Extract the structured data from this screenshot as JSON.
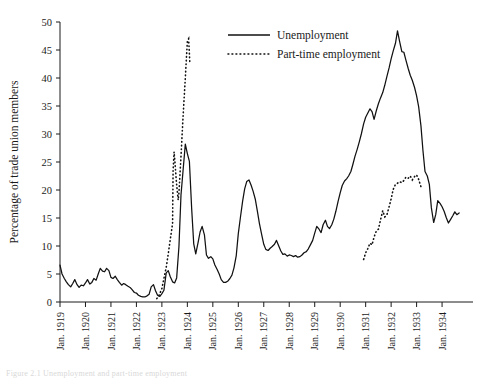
{
  "figure": {
    "caption": "Figure 2.1 Unemployment and part-time employment"
  },
  "chart_data": {
    "type": "line",
    "title": "",
    "xlabel": "",
    "ylabel": "Percentage of trade union members",
    "xlim": [
      1919.0,
      1934.9
    ],
    "ylim": [
      0,
      50
    ],
    "grid": false,
    "legend_position": "top-center-right",
    "y_ticks": [
      0,
      5,
      10,
      15,
      20,
      25,
      30,
      35,
      40,
      45,
      50
    ],
    "x_ticks": [
      1919,
      1920,
      1921,
      1922,
      1923,
      1924,
      1925,
      1926,
      1927,
      1928,
      1929,
      1930,
      1931,
      1932,
      1933,
      1934
    ],
    "x_tick_labels": [
      "Jan. 1919",
      "Jan. 1920",
      "Jan. 1921",
      "Jan. 1922",
      "Jan. 1923",
      "Jan. 1924",
      "Jan. 1925",
      "Jan. 1926",
      "Jan. 1927",
      "Jan. 1928",
      "Jan. 1929",
      "Jan. 1930",
      "Jan. 1931",
      "Jan. 1932",
      "Jan. 1933",
      "Jan. 1934"
    ],
    "series": [
      {
        "name": "Unemployment",
        "style": "solid",
        "x": [
          1919.0,
          1919.08,
          1919.17,
          1919.25,
          1919.33,
          1919.42,
          1919.5,
          1919.58,
          1919.67,
          1919.75,
          1919.83,
          1919.92,
          1920.0,
          1920.08,
          1920.17,
          1920.25,
          1920.33,
          1920.42,
          1920.5,
          1920.58,
          1920.67,
          1920.75,
          1920.83,
          1920.92,
          1921.0,
          1921.08,
          1921.17,
          1921.25,
          1921.33,
          1921.42,
          1921.5,
          1921.58,
          1921.67,
          1921.75,
          1921.83,
          1921.92,
          1922.0,
          1922.08,
          1922.17,
          1922.25,
          1922.33,
          1922.42,
          1922.5,
          1922.58,
          1922.67,
          1922.75,
          1922.83,
          1922.92,
          1923.0,
          1923.08,
          1923.17,
          1923.25,
          1923.33,
          1923.42,
          1923.5,
          1923.58,
          1923.67,
          1923.75,
          1923.83,
          1923.92,
          1924.0,
          1924.08,
          1924.17,
          1924.25,
          1924.33,
          1924.42,
          1924.5,
          1924.58,
          1924.67,
          1924.75,
          1924.83,
          1924.92,
          1925.0,
          1925.08,
          1925.17,
          1925.25,
          1925.33,
          1925.42,
          1925.5,
          1925.58,
          1925.67,
          1925.75,
          1925.83,
          1925.92,
          1926.0,
          1926.08,
          1926.17,
          1926.25,
          1926.33,
          1926.42,
          1926.5,
          1926.58,
          1926.67,
          1926.75,
          1926.83,
          1926.92,
          1927.0,
          1927.08,
          1927.17,
          1927.25,
          1927.33,
          1927.42,
          1927.5,
          1927.58,
          1927.67,
          1927.75,
          1927.83,
          1927.92,
          1928.0,
          1928.08,
          1928.17,
          1928.25,
          1928.33,
          1928.42,
          1928.5,
          1928.58,
          1928.67,
          1928.75,
          1928.83,
          1928.92,
          1929.0,
          1929.08,
          1929.17,
          1929.25,
          1929.33,
          1929.42,
          1929.5,
          1929.58,
          1929.67,
          1929.75,
          1929.83,
          1929.92,
          1930.0,
          1930.08,
          1930.17,
          1930.25,
          1930.33,
          1930.42,
          1930.5,
          1930.58,
          1930.67,
          1930.75,
          1930.83,
          1930.92,
          1931.0,
          1931.08,
          1931.17,
          1931.25,
          1931.33,
          1931.42,
          1931.5,
          1931.58,
          1931.67,
          1931.75,
          1931.83,
          1931.92,
          1932.0,
          1932.08,
          1932.17,
          1932.25,
          1932.33,
          1932.42,
          1932.5,
          1932.58,
          1932.67,
          1932.75,
          1932.83,
          1932.92,
          1933.0,
          1933.08,
          1933.17,
          1933.25,
          1933.33,
          1933.42,
          1933.5,
          1933.58,
          1933.67,
          1933.75,
          1933.83,
          1933.92,
          1934.0,
          1934.08,
          1934.17,
          1934.25,
          1934.33,
          1934.42,
          1934.5,
          1934.58,
          1934.67
        ],
        "values": [
          6.6,
          5.0,
          4.2,
          3.6,
          3.1,
          2.7,
          3.3,
          4.0,
          3.1,
          2.6,
          3.0,
          2.9,
          3.4,
          4.0,
          3.2,
          3.5,
          4.2,
          3.9,
          5.0,
          6.0,
          5.5,
          5.4,
          6.0,
          5.6,
          4.4,
          4.2,
          4.6,
          4.0,
          3.5,
          3.0,
          3.3,
          3.1,
          2.8,
          2.6,
          2.2,
          1.7,
          1.6,
          1.2,
          1.0,
          0.9,
          0.9,
          1.1,
          1.4,
          2.7,
          3.1,
          2.0,
          1.2,
          1.0,
          1.5,
          2.1,
          5.2,
          5.6,
          4.5,
          3.6,
          3.4,
          4.3,
          9.9,
          19.1,
          23.4,
          28.2,
          26.5,
          25.1,
          16.6,
          10.4,
          8.6,
          10.6,
          12.5,
          13.5,
          12.0,
          8.4,
          7.8,
          8.1,
          7.7,
          6.6,
          5.8,
          5.0,
          4.0,
          3.5,
          3.5,
          3.7,
          4.2,
          4.8,
          6.1,
          8.3,
          12.2,
          15.0,
          18.0,
          20.2,
          21.5,
          21.8,
          20.9,
          19.8,
          18.3,
          16.2,
          14.0,
          12.0,
          10.3,
          9.4,
          9.2,
          9.6,
          9.9,
          10.3,
          11.0,
          10.1,
          9.1,
          8.5,
          8.6,
          8.2,
          8.4,
          8.3,
          8.1,
          8.3,
          8.0,
          8.1,
          8.4,
          8.8,
          9.0,
          9.5,
          10.2,
          11.0,
          12.3,
          13.5,
          13.0,
          12.4,
          13.8,
          14.6,
          13.5,
          13.1,
          13.8,
          14.8,
          16.2,
          18.0,
          19.5,
          20.8,
          21.6,
          22.0,
          22.5,
          23.3,
          24.6,
          26.0,
          27.3,
          28.6,
          30.0,
          31.8,
          33.0,
          33.7,
          34.5,
          34.0,
          32.6,
          34.2,
          35.4,
          36.4,
          37.4,
          38.7,
          40.2,
          41.8,
          43.4,
          44.8,
          46.2,
          48.4,
          46.6,
          44.7,
          44.6,
          43.2,
          41.7,
          40.5,
          39.6,
          38.3,
          36.8,
          34.9,
          31.5,
          27.0,
          23.3,
          22.5,
          21.0,
          16.8,
          14.2,
          15.6,
          18.1,
          17.6,
          17.0,
          16.2,
          15.0,
          14.1,
          14.7,
          15.4,
          16.1,
          15.6,
          15.9
        ]
      },
      {
        "name": "Part-time employment",
        "style": "dotted",
        "segments": [
          {
            "x": [
              1922.8,
              1922.9,
              1923.0,
              1923.08,
              1923.17,
              1923.25,
              1923.33,
              1923.42,
              1923.44,
              1923.48,
              1923.52,
              1923.56,
              1923.6,
              1923.64,
              1923.67,
              1923.75,
              1923.83,
              1923.92,
              1924.0,
              1924.05,
              1924.1
            ],
            "values": [
              0.6,
              1.3,
              2.4,
              4.2,
              6.2,
              8.6,
              11.2,
              14.0,
              23.5,
              26.8,
              24.6,
              22.0,
              20.0,
              18.2,
              19.5,
              26.0,
              33.0,
              40.0,
              46.6,
              47.0,
              42.5
            ]
          },
          {
            "x": [
              1930.92,
              1931.0,
              1931.08,
              1931.17,
              1931.25,
              1931.33,
              1931.42,
              1931.5,
              1931.58,
              1931.67,
              1931.75,
              1931.83,
              1931.92,
              1932.0,
              1932.08,
              1932.17,
              1932.25,
              1932.33,
              1932.42,
              1932.5,
              1932.58,
              1932.67,
              1932.75,
              1932.83,
              1932.92,
              1933.0,
              1933.08,
              1933.17
            ],
            "values": [
              7.6,
              8.8,
              9.5,
              10.5,
              10.2,
              11.6,
              12.7,
              13.0,
              14.6,
              16.3,
              15.2,
              15.5,
              17.0,
              18.4,
              20.1,
              21.0,
              21.2,
              21.5,
              21.3,
              21.7,
              22.3,
              22.1,
              22.5,
              21.8,
              22.4,
              22.7,
              21.9,
              20.6
            ]
          }
        ]
      }
    ]
  },
  "legend": {
    "items": [
      {
        "label": "Unemployment",
        "style": "solid"
      },
      {
        "label": "Part-time employment",
        "style": "dotted"
      }
    ]
  }
}
